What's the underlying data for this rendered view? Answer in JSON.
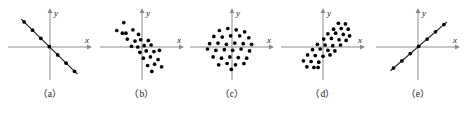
{
  "figure": {
    "title": "",
    "panel_count": 5,
    "axis_color": "#8a8a8a",
    "point_color": "#000000",
    "line_color": "#1a1a1a",
    "background": "#ffffff"
  },
  "chart_data": [
    {
      "type": "scatter",
      "caption": "（a）",
      "title": "",
      "xlabel": "x",
      "ylabel": "y",
      "xlim": [
        -10,
        10
      ],
      "ylim": [
        -10,
        10
      ],
      "grid": false,
      "legend": "none",
      "relationship": "perfect negative linear correlation",
      "has_trend_line": true,
      "points": [
        [
          -7.4,
          7.6
        ],
        [
          -5.0,
          5.1
        ],
        [
          -2.6,
          2.6
        ],
        [
          -0.2,
          0.1
        ],
        [
          2.2,
          -2.4
        ],
        [
          4.6,
          -4.9
        ],
        [
          7.0,
          -7.4
        ]
      ]
    },
    {
      "type": "scatter",
      "caption": "（b）",
      "title": "",
      "xlabel": "x",
      "ylabel": "y",
      "xlim": [
        -10,
        10
      ],
      "ylim": [
        -10,
        10
      ],
      "grid": false,
      "legend": "none",
      "relationship": "negative correlation scatter",
      "has_trend_line": false,
      "points": [
        [
          -5.2,
          7.4
        ],
        [
          -7.2,
          5.0
        ],
        [
          -5.6,
          4.2
        ],
        [
          -4.6,
          4.2
        ],
        [
          -2.6,
          5.2
        ],
        [
          -1.0,
          3.8
        ],
        [
          -4.2,
          2.4
        ],
        [
          -2.0,
          1.8
        ],
        [
          -0.4,
          2.2
        ],
        [
          1.8,
          2.0
        ],
        [
          -3.0,
          0.2
        ],
        [
          -1.2,
          0.0
        ],
        [
          0.6,
          0.4
        ],
        [
          2.6,
          0.6
        ],
        [
          -0.6,
          -1.6
        ],
        [
          1.2,
          -1.2
        ],
        [
          3.4,
          -1.4
        ],
        [
          5.0,
          -1.0
        ],
        [
          0.4,
          -3.4
        ],
        [
          2.4,
          -3.0
        ],
        [
          4.6,
          -3.8
        ],
        [
          1.6,
          -5.6
        ],
        [
          3.6,
          -5.2
        ],
        [
          5.6,
          -6.0
        ],
        [
          2.8,
          -7.4
        ]
      ]
    },
    {
      "type": "scatter",
      "caption": "（c）",
      "title": "",
      "xlabel": "x",
      "ylabel": "y",
      "xlim": [
        -10,
        10
      ],
      "ylim": [
        -10,
        10
      ],
      "grid": false,
      "legend": "none",
      "relationship": "no correlation, circular random cloud",
      "has_trend_line": false,
      "points": [
        [
          -3.6,
          5.0
        ],
        [
          -1.2,
          5.6
        ],
        [
          1.2,
          5.2
        ],
        [
          3.6,
          4.6
        ],
        [
          -5.2,
          3.2
        ],
        [
          -2.8,
          3.0
        ],
        [
          -0.4,
          3.4
        ],
        [
          2.2,
          3.4
        ],
        [
          4.8,
          2.8
        ],
        [
          -6.4,
          1.0
        ],
        [
          -4.0,
          1.2
        ],
        [
          -1.6,
          0.8
        ],
        [
          0.8,
          1.2
        ],
        [
          3.2,
          1.0
        ],
        [
          5.6,
          0.8
        ],
        [
          -7.0,
          -0.6
        ],
        [
          -4.6,
          -1.0
        ],
        [
          -2.2,
          -0.8
        ],
        [
          0.2,
          -1.0
        ],
        [
          2.6,
          -0.6
        ],
        [
          5.0,
          -1.2
        ],
        [
          -5.4,
          -3.0
        ],
        [
          -3.0,
          -3.4
        ],
        [
          -0.6,
          -3.0
        ],
        [
          1.8,
          -3.2
        ],
        [
          4.2,
          -3.4
        ],
        [
          -3.8,
          -5.4
        ],
        [
          -1.4,
          -5.0
        ],
        [
          1.0,
          -5.4
        ],
        [
          3.4,
          -5.0
        ],
        [
          -0.2,
          -6.8
        ]
      ]
    },
    {
      "type": "scatter",
      "caption": "（d）",
      "title": "",
      "xlabel": "x",
      "ylabel": "y",
      "xlim": [
        -10,
        10
      ],
      "ylim": [
        -10,
        10
      ],
      "grid": false,
      "legend": "none",
      "relationship": "positive correlation scatter",
      "has_trend_line": false,
      "points": [
        [
          4.4,
          7.2
        ],
        [
          6.4,
          7.0
        ],
        [
          3.0,
          5.4
        ],
        [
          5.2,
          5.6
        ],
        [
          7.2,
          5.4
        ],
        [
          1.4,
          4.0
        ],
        [
          3.6,
          4.2
        ],
        [
          5.8,
          3.8
        ],
        [
          7.6,
          3.4
        ],
        [
          0.2,
          2.4
        ],
        [
          2.4,
          2.6
        ],
        [
          4.6,
          2.2
        ],
        [
          6.6,
          2.0
        ],
        [
          -1.6,
          0.8
        ],
        [
          0.6,
          0.6
        ],
        [
          2.8,
          0.4
        ],
        [
          5.0,
          0.6
        ],
        [
          -3.0,
          -0.8
        ],
        [
          -0.8,
          -0.6
        ],
        [
          1.4,
          -1.0
        ],
        [
          3.4,
          -1.2
        ],
        [
          -4.4,
          -2.4
        ],
        [
          -2.2,
          -2.6
        ],
        [
          0.0,
          -2.8
        ],
        [
          2.0,
          -2.4
        ],
        [
          -5.6,
          -4.2
        ],
        [
          -3.4,
          -4.4
        ],
        [
          -1.2,
          -4.6
        ],
        [
          -4.6,
          -6.0
        ],
        [
          -2.6,
          -6.2
        ],
        [
          -1.4,
          -6.2
        ]
      ]
    },
    {
      "type": "scatter",
      "caption": "（e）",
      "title": "",
      "xlabel": "x",
      "ylabel": "y",
      "xlim": [
        -10,
        10
      ],
      "ylim": [
        -10,
        10
      ],
      "grid": false,
      "legend": "none",
      "relationship": "perfect positive linear correlation",
      "has_trend_line": true,
      "points": [
        [
          -7.0,
          -6.4
        ],
        [
          -4.6,
          -4.2
        ],
        [
          -2.2,
          -2.0
        ],
        [
          0.2,
          0.2
        ],
        [
          2.6,
          2.4
        ],
        [
          5.0,
          4.6
        ],
        [
          7.4,
          6.8
        ]
      ]
    }
  ]
}
